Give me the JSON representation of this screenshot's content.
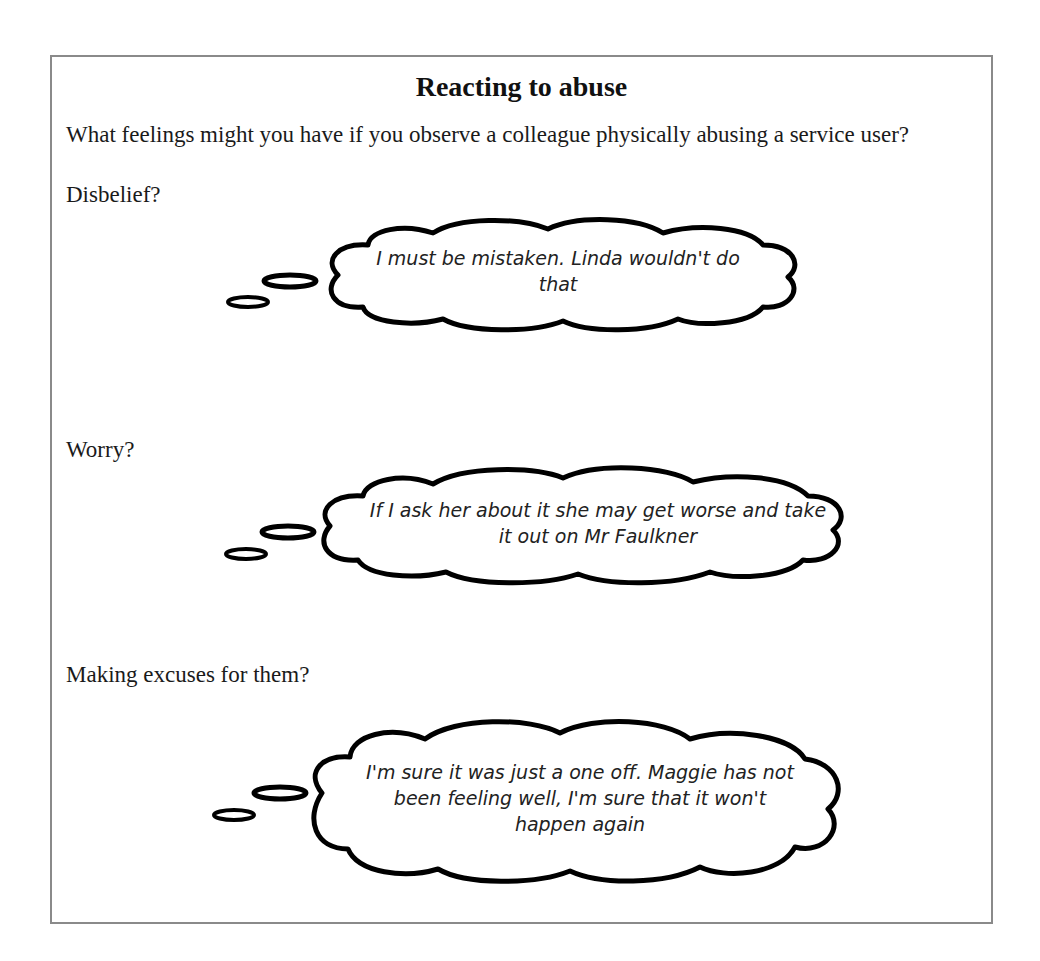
{
  "document": {
    "title": "Reacting to abuse",
    "question": "What feelings might you have if you observe a colleague physically abusing a service user?",
    "sections": [
      {
        "label": "Disbelief?",
        "thought": "I must be mistaken. Linda wouldn't do that"
      },
      {
        "label": "Worry?",
        "thought": "If I ask her about it she may get worse and take it out on Mr Faulkner"
      },
      {
        "label": "Making excuses for them?",
        "thought": "I'm sure it was just a one off. Maggie has not been feeling well, I'm sure that it won't happen again"
      }
    ]
  },
  "colors": {
    "border": "#8a8a8a",
    "text": "#1a1a1a",
    "cloud_stroke": "#000000",
    "background": "#ffffff"
  }
}
